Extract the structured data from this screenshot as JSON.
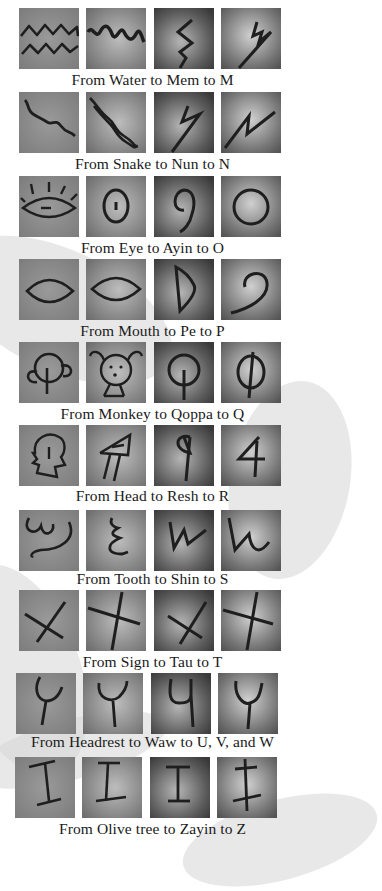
{
  "rows": [
    {
      "caption": "From Water to Mem to M",
      "glyphs": [
        "water-pictograph",
        "mem-proto",
        "mem-phoenician",
        "m-early"
      ]
    },
    {
      "caption": "From Snake to Nun to N",
      "glyphs": [
        "snake-pictograph",
        "nun-proto",
        "nun-phoenician",
        "n-early"
      ]
    },
    {
      "caption": "From Eye to Ayin to O",
      "glyphs": [
        "eye-pictograph",
        "ayin-proto",
        "ayin-phoenician",
        "o-early"
      ]
    },
    {
      "caption": "From Mouth to Pe to P",
      "glyphs": [
        "mouth-pictograph",
        "pe-proto",
        "pe-phoenician",
        "p-early"
      ]
    },
    {
      "caption": "From Monkey to Qoppa to Q",
      "glyphs": [
        "monkey-pictograph",
        "qoppa-proto",
        "qoppa-phoenician",
        "q-early"
      ]
    },
    {
      "caption": "From Head to Resh to R",
      "glyphs": [
        "head-pictograph",
        "resh-proto",
        "resh-phoenician",
        "r-early"
      ]
    },
    {
      "caption": "From Tooth to Shin to S",
      "glyphs": [
        "tooth-pictograph",
        "shin-proto",
        "shin-phoenician",
        "s-early"
      ]
    },
    {
      "caption": "From Sign to Tau to T",
      "glyphs": [
        "sign-pictograph",
        "tau-proto",
        "tau-phoenician",
        "t-early"
      ]
    },
    {
      "caption": "From Headrest to Waw to U, V, and W",
      "glyphs": [
        "headrest-pictograph",
        "waw-proto",
        "waw-phoenician",
        "uvw-early"
      ]
    },
    {
      "caption": "From Olive tree to Zayin to Z",
      "glyphs": [
        "olive-tree-pictograph",
        "zayin-proto",
        "zayin-phoenician",
        "z-early"
      ]
    }
  ],
  "colors": {
    "tile_light": "#8c8c8c",
    "tile_dark": "#3e3e3e",
    "ink": "#1e1e1e",
    "background": "#ffffff"
  }
}
